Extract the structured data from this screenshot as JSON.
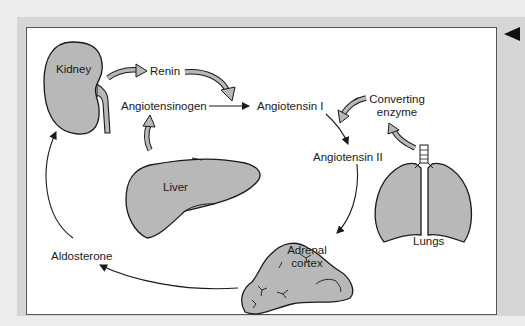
{
  "diagram": {
    "organs": {
      "kidney": "Kidney",
      "liver": "Liver",
      "lungs": "Lungs",
      "adrenal_line1": "Adrenal",
      "adrenal_line2": "cortex"
    },
    "substances": {
      "renin": "Renin",
      "angiotensinogen": "Angiotensinogen",
      "angiotensin_1": "Angiotensin I",
      "angiotensin_2": "Angiotensin II",
      "converting_line1": "Converting",
      "converting_line2": "enzyme",
      "aldosterone": "Aldosterone"
    },
    "colors": {
      "organ_fill": "#b8b8b8",
      "outline": "#1a1a1a",
      "frame_band": "#d6d6d6",
      "panel": "#ffffff"
    },
    "flow": [
      {
        "from": "Kidney",
        "to": "Renin"
      },
      {
        "from": "Renin",
        "to": "Angiotensin I"
      },
      {
        "from": "Liver",
        "to": "Angiotensinogen"
      },
      {
        "from": "Angiotensinogen",
        "to": "Angiotensin I"
      },
      {
        "from": "Lungs",
        "to": "Converting enzyme"
      },
      {
        "from": "Converting enzyme",
        "to": "Angiotensin I"
      },
      {
        "from": "Angiotensin I",
        "to": "Angiotensin II"
      },
      {
        "from": "Angiotensin II",
        "to": "Adrenal cortex"
      },
      {
        "from": "Adrenal cortex",
        "to": "Aldosterone"
      },
      {
        "from": "Aldosterone",
        "to": "Kidney"
      }
    ]
  },
  "navigation": {
    "back_arrow": "previous-arrow"
  }
}
